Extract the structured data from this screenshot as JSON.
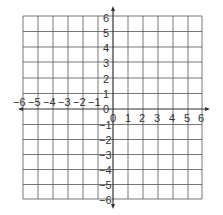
{
  "diagram": {
    "type": "coordinate-plane",
    "x_range": [
      -6,
      6
    ],
    "y_range": [
      -6,
      6
    ],
    "grid": true,
    "colors": {
      "grid": "#555555",
      "axis": "#333333",
      "label": "#333333",
      "background": "#ffffff"
    },
    "x_tick_labels": [
      "-6",
      "-5",
      "-4",
      "-3",
      "-2",
      "-1",
      "0",
      "1",
      "2",
      "3",
      "4",
      "5",
      "6"
    ],
    "y_tick_labels": [
      "6",
      "5",
      "4",
      "3",
      "2",
      "1",
      "0",
      "-1",
      "-2",
      "-3",
      "-4",
      "-5",
      "-6"
    ],
    "labels": {
      "xn6": "−6",
      "xn5": "−5",
      "xn4": "−4",
      "xn3": "−3",
      "xn2": "−2",
      "xn1": "−1",
      "x0": "0",
      "x1": "1",
      "x2": "2",
      "x3": "3",
      "x4": "4",
      "x5": "5",
      "x6": "6",
      "y6": "6",
      "y5": "5",
      "y4": "4",
      "y3": "3",
      "y2": "2",
      "y1": "1",
      "y0": "0",
      "yn1": "−1",
      "yn2": "−2",
      "yn3": "−3",
      "yn4": "−4",
      "yn5": "−5",
      "yn6": "−6"
    }
  }
}
